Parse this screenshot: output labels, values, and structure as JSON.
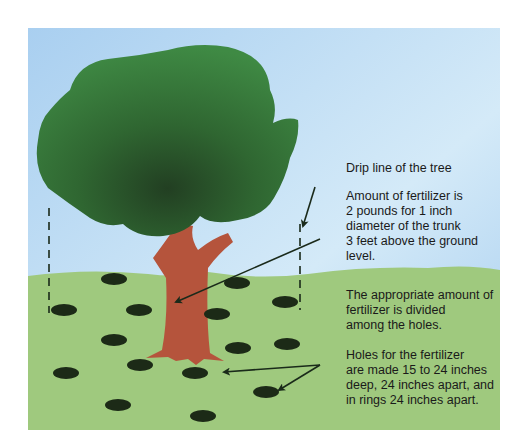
{
  "diagram": {
    "colors": {
      "sky_top": "#a9cff0",
      "sky_bottom": "#d9ecf8",
      "grass": "#9fc97e",
      "canopy": "#3f8a44",
      "canopy_dark": "#27532b",
      "trunk": "#b5543c",
      "hole": "#1c2a17",
      "arrow": "#1a2a1a"
    },
    "labels": {
      "drip_line": [
        "Drip line of the tree"
      ],
      "amount": [
        "Amount of fertilizer is",
        "2 pounds for 1 inch",
        "diameter of the trunk",
        "3 feet above the ground",
        "level."
      ],
      "divided": [
        "The appropriate amount of",
        "fertilizer is divided",
        "among the holes."
      ],
      "holes": [
        "Holes for the fertilizer",
        "are made 15 to 24 inches",
        "deep, 24 inches apart, and",
        "in rings 24 inches apart."
      ]
    },
    "elements": {
      "drip_line_left": "dashed vertical line at canopy edge (left)",
      "drip_line_right": "dashed vertical line at canopy edge (right)",
      "hole_count": 17
    }
  }
}
